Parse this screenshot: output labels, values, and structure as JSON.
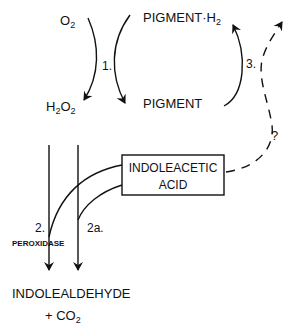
{
  "diagram": {
    "type": "biochemical pathway",
    "nodes": {
      "o2": {
        "base": "O",
        "sub": "2"
      },
      "h2o2": {
        "p1": "H",
        "s1": "2",
        "p2": "O",
        "s2": "2"
      },
      "pigment_h2": {
        "base": "PIGMENT·H",
        "sub": "2"
      },
      "pigment": "PIGMENT",
      "iaa_line1": "INDOLEACETIC",
      "iaa_line2": "ACID",
      "product_line1": "INDOLEALDEHYDE",
      "product_line2": {
        "base": "+ CO",
        "sub": "2"
      }
    },
    "labels": {
      "step1": "1.",
      "step2": "2.",
      "step2a": "2a.",
      "step3": "3.",
      "unknown": "?",
      "enzyme": "PEROXIDASE"
    },
    "edges": [
      {
        "from": "O2",
        "to": "H2O2",
        "label": "1."
      },
      {
        "from": "PIGMENT·H2",
        "to": "PIGMENT",
        "label": "1."
      },
      {
        "from": "PIGMENT",
        "to": "PIGMENT·H2",
        "label": "3."
      },
      {
        "from": "INDOLEACETIC ACID",
        "to": "PIGMENT·H2",
        "label": "?",
        "style": "dashed"
      },
      {
        "from": "H2O2",
        "to": "INDOLEALDEHYDE + CO2",
        "label": "2.",
        "via": "PEROXIDASE"
      },
      {
        "from": "INDOLEACETIC ACID",
        "to": "INDOLEALDEHYDE + CO2",
        "label": "2a."
      }
    ],
    "colors": {
      "ink": "#111111",
      "background": "#ffffff"
    }
  }
}
